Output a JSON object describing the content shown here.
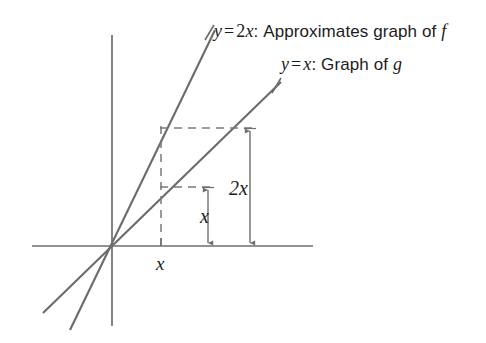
{
  "figure": {
    "colors": {
      "axis": "#6e6e6e",
      "line": "#6b6b6b",
      "dashed": "#7a7a7a",
      "arrow": "#6e6e6e",
      "text": "#1c1c1c",
      "background": "#ffffff"
    },
    "labels": {
      "line_2x": {
        "y": "y",
        "equals": "=",
        "rhs": "2x",
        "rhs_coef": "2",
        "rhs_var": "x",
        "colon": ":",
        "description": "Approximates graph of",
        "function": "f",
        "full_text": "y = 2x: Approximates graph of f"
      },
      "line_x": {
        "y": "y",
        "equals": "=",
        "rhs_var": "x",
        "colon": ":",
        "description": "Graph of",
        "function": "g",
        "full_text": "y = x: Graph of g"
      },
      "dim_x_vertical": "x",
      "dim_2x_vertical": "2x",
      "axis_x_tick": "x"
    },
    "geometry": {
      "origin": {
        "x": 112,
        "y": 246
      },
      "x_axis": {
        "x1": 32,
        "y1": 246,
        "x2": 313,
        "y2": 246
      },
      "y_axis": {
        "x1": 112,
        "y1": 35,
        "x2": 112,
        "y2": 326
      },
      "line_2x_points": {
        "x1": 70,
        "y1": 330,
        "x2": 215,
        "y2": 30
      },
      "line_x_points": {
        "x1": 43,
        "y1": 313,
        "x2": 281,
        "y2": 82
      },
      "foot_x": 161,
      "y_at_x": 187,
      "y_at_2x": 128,
      "dashed_top": {
        "x1": 161,
        "y1": 128,
        "x2": 251,
        "y2": 128
      },
      "dashed_mid": {
        "x1": 161,
        "y1": 187,
        "x2": 209,
        "y2": 187
      },
      "dashed_vertical": {
        "x1": 161,
        "y1": 128,
        "x2": 161,
        "y2": 246
      },
      "arrow_x": {
        "x": 208,
        "y1": 187,
        "y2": 246
      },
      "arrow_2x": {
        "x": 250,
        "y1": 128,
        "y2": 246
      },
      "tick_x_axis": {
        "x": 161,
        "y1": 240,
        "y2": 252
      }
    }
  }
}
